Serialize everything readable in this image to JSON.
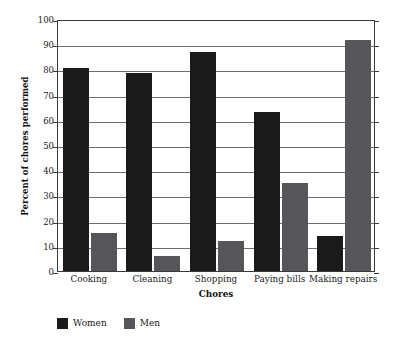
{
  "chart_data": {
    "type": "bar",
    "title": "",
    "xlabel": "Chores",
    "ylabel": "Percent of chores performed",
    "categories": [
      "Cooking",
      "Cleaning",
      "Shopping",
      "Paying bills",
      "Making repairs"
    ],
    "series": [
      {
        "name": "Women",
        "color": "#1a1a1a",
        "values": [
          80.5,
          78.5,
          87,
          63,
          14
        ]
      },
      {
        "name": "Men",
        "color": "#55555a",
        "values": [
          15,
          6,
          12,
          35,
          91.5
        ]
      }
    ],
    "ylim": [
      0,
      100
    ],
    "ytick_values": [
      0,
      10,
      20,
      30,
      40,
      50,
      60,
      70,
      80,
      90,
      100
    ],
    "ytick_labels": [
      "0",
      "10",
      "20",
      "30",
      "40",
      "50",
      "60",
      "70",
      "80",
      "90",
      "100"
    ],
    "grid": true,
    "grid_axis": "y",
    "legend_position": "below-axes-left",
    "legend_entries": [
      "Women",
      "Men"
    ]
  }
}
